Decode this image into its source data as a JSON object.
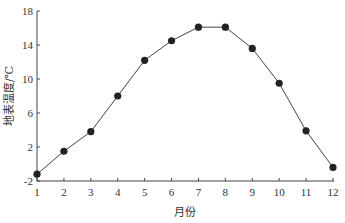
{
  "chart_data": {
    "type": "line",
    "title": "",
    "xlabel": "月份",
    "ylabel": "地表温度/℃",
    "categories": [
      "1",
      "2",
      "3",
      "4",
      "5",
      "6",
      "7",
      "8",
      "9",
      "10",
      "11",
      "12"
    ],
    "x": [
      1,
      2,
      3,
      4,
      5,
      6,
      7,
      8,
      9,
      10,
      11,
      12
    ],
    "series": [
      {
        "name": "地表温度",
        "values": [
          -1.2,
          1.5,
          3.8,
          8.0,
          12.2,
          14.5,
          16.1,
          16.1,
          13.6,
          9.5,
          3.9,
          -0.4
        ],
        "marker": "circle",
        "color": "#222222"
      }
    ],
    "xlim": [
      1,
      12
    ],
    "ylim": [
      -2,
      18
    ],
    "yticks": [
      -2,
      2,
      6,
      10,
      14,
      18
    ],
    "xticks": [
      1,
      2,
      3,
      4,
      5,
      6,
      7,
      8,
      9,
      10,
      11,
      12
    ],
    "grid": false,
    "legend": "none"
  }
}
